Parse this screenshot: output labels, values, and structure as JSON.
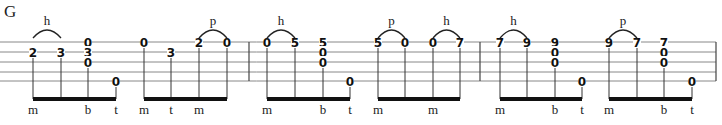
{
  "chord": "G",
  "staff": {
    "lines_y": [
      42,
      52,
      62,
      72,
      81
    ],
    "x_start": 0,
    "x_end": 716,
    "barlines_x": [
      249,
      480,
      716
    ],
    "beam_y": 99,
    "label_y": 114,
    "line_color": "#888888",
    "ink_color": "#111111"
  },
  "groups": [
    {
      "notes": [
        {
          "x": 33,
          "frets": [
            {
              "string": 2,
              "fret": "2"
            }
          ],
          "finger": "m"
        },
        {
          "x": 61,
          "frets": [
            {
              "string": 2,
              "fret": "3"
            }
          ],
          "finger": ""
        },
        {
          "x": 88,
          "frets": [
            {
              "string": 1,
              "fret": "0"
            },
            {
              "string": 2,
              "fret": "3"
            },
            {
              "string": 3,
              "fret": "0"
            }
          ],
          "finger": "b"
        },
        {
          "x": 116,
          "frets": [
            {
              "string": 5,
              "fret": "0"
            }
          ],
          "finger": "t"
        }
      ],
      "slurs": [
        {
          "from": 0,
          "to": 1,
          "label": "h"
        }
      ]
    },
    {
      "notes": [
        {
          "x": 144,
          "frets": [
            {
              "string": 1,
              "fret": "0"
            }
          ],
          "finger": "m"
        },
        {
          "x": 171,
          "frets": [
            {
              "string": 2,
              "fret": "3"
            }
          ],
          "finger": "t"
        },
        {
          "x": 199,
          "frets": [
            {
              "string": 1,
              "fret": "2"
            }
          ],
          "finger": "m"
        },
        {
          "x": 227,
          "frets": [
            {
              "string": 1,
              "fret": "0"
            }
          ],
          "finger": ""
        }
      ],
      "slurs": [
        {
          "from": 2,
          "to": 3,
          "label": "p"
        }
      ]
    },
    {
      "notes": [
        {
          "x": 267,
          "frets": [
            {
              "string": 1,
              "fret": "0"
            }
          ],
          "finger": "m"
        },
        {
          "x": 295,
          "frets": [
            {
              "string": 1,
              "fret": "5"
            }
          ],
          "finger": ""
        },
        {
          "x": 323,
          "frets": [
            {
              "string": 1,
              "fret": "5"
            },
            {
              "string": 2,
              "fret": "0"
            },
            {
              "string": 3,
              "fret": "0"
            }
          ],
          "finger": "b"
        },
        {
          "x": 350,
          "frets": [
            {
              "string": 5,
              "fret": "0"
            }
          ],
          "finger": "t"
        }
      ],
      "slurs": [
        {
          "from": 0,
          "to": 1,
          "label": "h"
        }
      ]
    },
    {
      "notes": [
        {
          "x": 378,
          "frets": [
            {
              "string": 1,
              "fret": "5"
            }
          ],
          "finger": "m"
        },
        {
          "x": 405,
          "frets": [
            {
              "string": 1,
              "fret": "0"
            }
          ],
          "finger": ""
        },
        {
          "x": 433,
          "frets": [
            {
              "string": 1,
              "fret": "0"
            }
          ],
          "finger": "m"
        },
        {
          "x": 460,
          "frets": [
            {
              "string": 1,
              "fret": "7"
            }
          ],
          "finger": ""
        }
      ],
      "slurs": [
        {
          "from": 0,
          "to": 1,
          "label": "p"
        },
        {
          "from": 2,
          "to": 3,
          "label": "h"
        }
      ]
    },
    {
      "notes": [
        {
          "x": 500,
          "frets": [
            {
              "string": 1,
              "fret": "7"
            }
          ],
          "finger": "m"
        },
        {
          "x": 527,
          "frets": [
            {
              "string": 1,
              "fret": "9"
            }
          ],
          "finger": ""
        },
        {
          "x": 555,
          "frets": [
            {
              "string": 1,
              "fret": "9"
            },
            {
              "string": 2,
              "fret": "0"
            },
            {
              "string": 3,
              "fret": "0"
            }
          ],
          "finger": "b"
        },
        {
          "x": 582,
          "frets": [
            {
              "string": 5,
              "fret": "0"
            }
          ],
          "finger": "t"
        }
      ],
      "slurs": [
        {
          "from": 0,
          "to": 1,
          "label": "h"
        }
      ]
    },
    {
      "notes": [
        {
          "x": 609,
          "frets": [
            {
              "string": 1,
              "fret": "9"
            }
          ],
          "finger": "m"
        },
        {
          "x": 637,
          "frets": [
            {
              "string": 1,
              "fret": "7"
            }
          ],
          "finger": ""
        },
        {
          "x": 664,
          "frets": [
            {
              "string": 1,
              "fret": "7"
            },
            {
              "string": 2,
              "fret": "0"
            },
            {
              "string": 3,
              "fret": "0"
            }
          ],
          "finger": "b"
        },
        {
          "x": 692,
          "frets": [
            {
              "string": 5,
              "fret": "0"
            }
          ],
          "finger": "t"
        }
      ],
      "slurs": [
        {
          "from": 0,
          "to": 1,
          "label": "p"
        }
      ]
    }
  ]
}
